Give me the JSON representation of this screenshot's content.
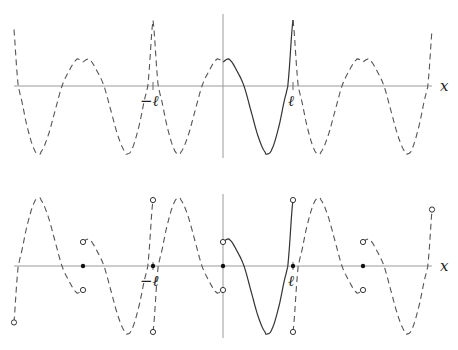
{
  "figure": {
    "axis_label_x": "x",
    "tick_labels": {
      "neg_l": "−ℓ",
      "pos_l": "ℓ"
    }
  },
  "geometry": {
    "x_axis_start": 14,
    "x_axis_end": 432,
    "origin_x": 223,
    "l_px": 70,
    "top": {
      "axis_y": 86,
      "yaxis_top": 14,
      "yaxis_bottom": 158
    },
    "bottom": {
      "axis_y": 266,
      "yaxis_top": 194,
      "yaxis_bottom": 338
    }
  },
  "function_samples": {
    "note": "f(t) on t in [0,1] (t = x/l); value in px above axis",
    "t": [
      0,
      0.05,
      0.1,
      0.2,
      0.3,
      0.4,
      0.5,
      0.6,
      0.63,
      0.7,
      0.8,
      0.9,
      0.93,
      1.0
    ],
    "v": [
      24,
      26.5,
      26,
      15,
      0,
      -25,
      -50,
      -66,
      -68,
      -63,
      -40,
      -8,
      4,
      66
    ]
  },
  "panels": [
    {
      "id": "even-extension",
      "name": "top-panel",
      "type": "even"
    },
    {
      "id": "odd-extension",
      "name": "bottom-panel",
      "type": "odd"
    }
  ]
}
